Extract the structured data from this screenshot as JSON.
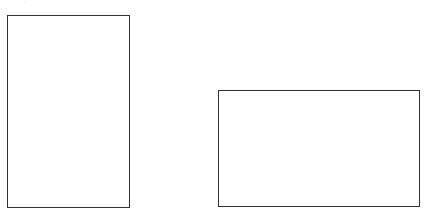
{
  "diagram": {
    "top_fragment": ".",
    "shapes": [
      {
        "name": "portrait-rectangle",
        "orientation": "portrait",
        "stroke": "#333333",
        "fill": "#ffffff"
      },
      {
        "name": "landscape-rectangle",
        "orientation": "landscape",
        "stroke": "#333333",
        "fill": "#ffffff"
      }
    ]
  }
}
